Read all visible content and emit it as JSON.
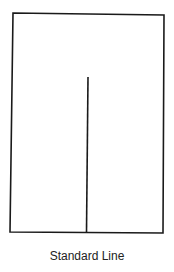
{
  "diagram": {
    "caption": "Standard Line",
    "frame": {
      "x1": 13,
      "y1": 13,
      "x2": 164,
      "y2": 232,
      "stroke": "#1a1a1a"
    },
    "line": {
      "x1": 88,
      "y1": 77,
      "x2": 86,
      "y2": 232,
      "stroke": "#1a1a1a"
    }
  }
}
